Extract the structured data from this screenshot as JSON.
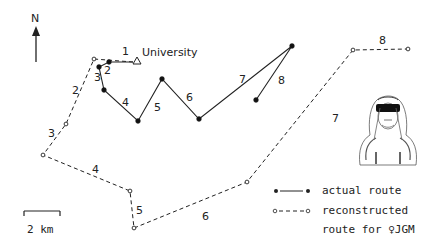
{
  "north_label": "N",
  "start_label": "University",
  "scale_label": "2 km",
  "legend": {
    "actual": "actual route",
    "reconstructed_1": "reconstructed",
    "reconstructed_2": "route for ♀JGM"
  },
  "colors": {
    "line": "#222222",
    "background": "#ffffff"
  },
  "actual_route": {
    "points": [
      [
        133,
        62
      ],
      [
        109,
        62
      ],
      [
        99,
        67
      ],
      [
        104,
        90
      ],
      [
        138,
        121
      ],
      [
        162,
        79
      ],
      [
        199,
        119
      ],
      [
        292,
        46
      ],
      [
        256,
        100
      ]
    ],
    "segment_labels": [
      {
        "n": "1",
        "x": 122,
        "y": 55
      },
      {
        "n": "2",
        "x": 104,
        "y": 74
      },
      {
        "n": "3",
        "x": 94,
        "y": 81
      },
      {
        "n": "4",
        "x": 122,
        "y": 106
      },
      {
        "n": "5",
        "x": 154,
        "y": 111
      },
      {
        "n": "6",
        "x": 186,
        "y": 101
      },
      {
        "n": "7",
        "x": 239,
        "y": 83
      },
      {
        "n": "8",
        "x": 278,
        "y": 84
      }
    ]
  },
  "reconstructed_route": {
    "points": [
      [
        133,
        62
      ],
      [
        94,
        59
      ],
      [
        66,
        124
      ],
      [
        43,
        155
      ],
      [
        130,
        191
      ],
      [
        134,
        228
      ],
      [
        247,
        182
      ],
      [
        353,
        50
      ],
      [
        408,
        49
      ]
    ],
    "segment_labels": [
      {
        "n": "2",
        "x": 72,
        "y": 94
      },
      {
        "n": "3",
        "x": 48,
        "y": 137
      },
      {
        "n": "4",
        "x": 92,
        "y": 173
      },
      {
        "n": "5",
        "x": 136,
        "y": 214
      },
      {
        "n": "6",
        "x": 202,
        "y": 220
      },
      {
        "n": "7",
        "x": 332,
        "y": 122
      },
      {
        "n": "8",
        "x": 379,
        "y": 44
      }
    ]
  }
}
